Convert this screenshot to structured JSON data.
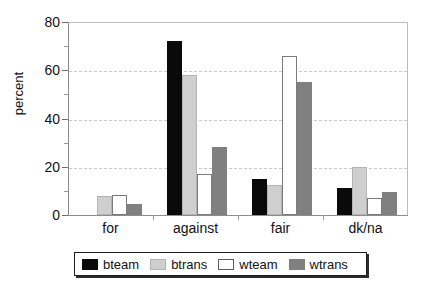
{
  "chart_data": {
    "type": "bar",
    "title": "",
    "xlabel": "",
    "ylabel": "percent",
    "ylim": [
      0,
      80
    ],
    "ytick_values": [
      0,
      20,
      40,
      60,
      80
    ],
    "ytick_labels": [
      "0",
      "20",
      "40",
      "60",
      "80"
    ],
    "yminor_values": [
      10,
      30,
      50,
      70
    ],
    "grid": true,
    "legend_position": "bottom",
    "categories": [
      "for",
      "against",
      "fair",
      "dk/na"
    ],
    "series": [
      {
        "name": "bteam",
        "color": "#0a0a0a",
        "values": [
          0,
          72,
          15,
          11
        ]
      },
      {
        "name": "btrans",
        "color": "#cfcfcf",
        "values": [
          8,
          58,
          12.5,
          20
        ]
      },
      {
        "name": "wteam",
        "color": "#ffffff",
        "values": [
          8.5,
          17,
          66,
          7
        ]
      },
      {
        "name": "wtrans",
        "color": "#808080",
        "values": [
          4.5,
          28,
          55,
          9.5
        ]
      }
    ]
  },
  "legend": {
    "items": [
      {
        "label": "bteam"
      },
      {
        "label": "btrans"
      },
      {
        "label": "wteam"
      },
      {
        "label": "wtrans"
      }
    ]
  }
}
